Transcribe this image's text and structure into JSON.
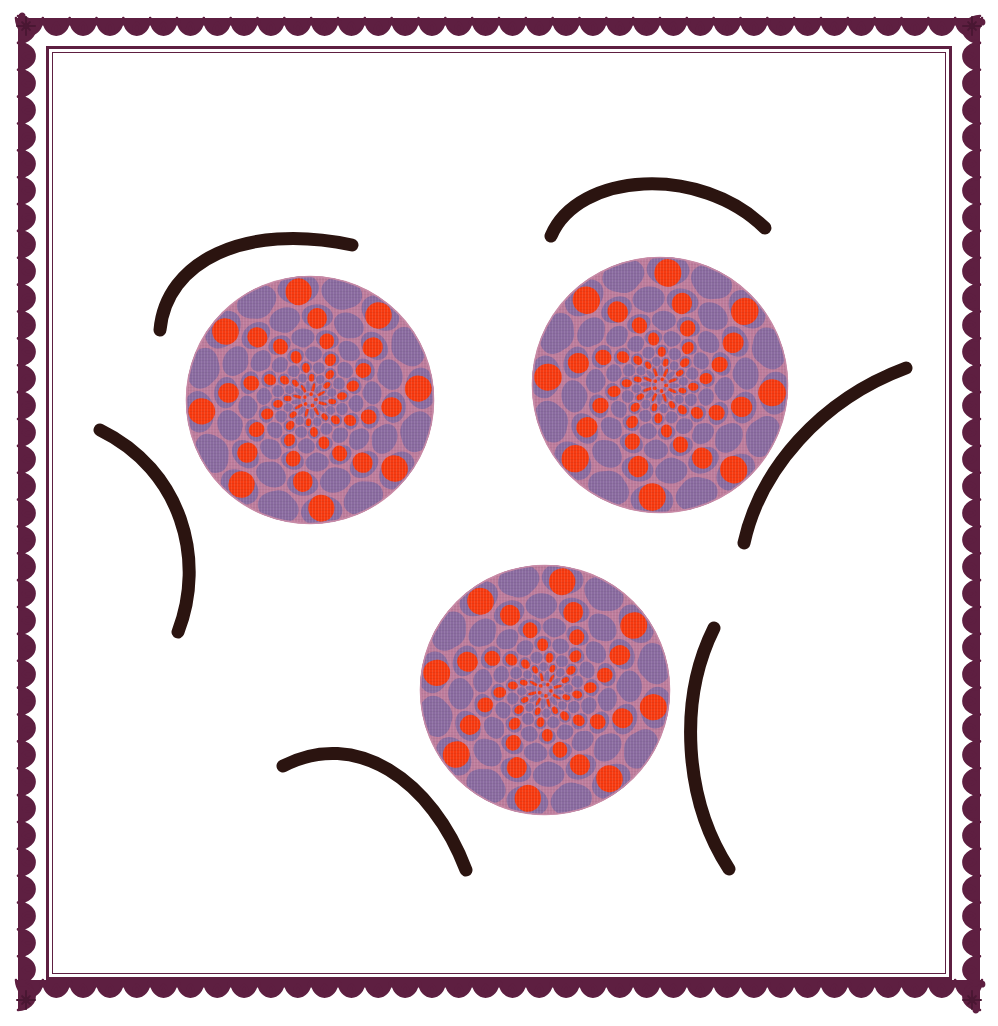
{
  "artwork": {
    "title": "Decorative Floral Rosette Panel",
    "canvas": {
      "width": 998,
      "height": 1026,
      "background": "#ffffff"
    },
    "palette": {
      "frame_ornament": "#5E1F41",
      "frame_ornament_dark": "#4A1733",
      "frame_line": "#5E1F41",
      "arc_stroke": "#2B1410",
      "petal_orange": "#F73A10",
      "petal_purple": "#8A6BA0",
      "disc_background": "#C98BA6",
      "disc_mauve": "#BE7C9C",
      "paper_white": "#ffffff"
    },
    "frame": {
      "name": "scalloped-lace-border",
      "outer_inset": 16,
      "scallop_band_thickness": 26,
      "scallop_period": 27,
      "rule_outer_offset": 46,
      "rule_inner_offset": 52,
      "rule_thickness_outer": 3,
      "rule_thickness_inner": 1,
      "corner_ornament": "starburst-floret"
    },
    "flowers": [
      {
        "id": "flower-top-left",
        "label": "Rosette 1",
        "cx": 310,
        "cy": 400,
        "radius": 124,
        "rings": 7,
        "petals_per_ring": 16,
        "rotation_per_ring_deg": 11,
        "base_rotation_deg": -6
      },
      {
        "id": "flower-top-right",
        "label": "Rosette 2",
        "cx": 660,
        "cy": 385,
        "radius": 128,
        "rings": 7,
        "petals_per_ring": 16,
        "rotation_per_ring_deg": 11,
        "base_rotation_deg": 4
      },
      {
        "id": "flower-bottom-center",
        "label": "Rosette 3",
        "cx": 545,
        "cy": 690,
        "radius": 125,
        "rings": 7,
        "petals_per_ring": 16,
        "rotation_per_ring_deg": 11,
        "base_rotation_deg": 9
      }
    ],
    "arcs": [
      {
        "id": "arc-upper-left",
        "label": "Upper left arch",
        "path": "M 160 330 C 166 262 244 222 352 245",
        "width": 13
      },
      {
        "id": "arc-upper-right",
        "label": "Upper right arch",
        "path": "M 551 236 C 578 172 700 164 765 228",
        "width": 13
      },
      {
        "id": "arc-left-crescent",
        "label": "Left crescent",
        "path": "M 100 430 C 182 470 206 560 178 632",
        "width": 13
      },
      {
        "id": "arc-right-diagonal",
        "label": "Right diagonal sweep",
        "path": "M 906 368 C 820 400 760 470 744 543",
        "width": 13
      },
      {
        "id": "arc-lower-left",
        "label": "Lower left sweep",
        "path": "M 283 766 C 356 728 432 780 466 870",
        "width": 13
      },
      {
        "id": "arc-lower-right",
        "label": "Lower right crescent",
        "path": "M 714 628 C 678 700 684 800 729 869",
        "width": 13
      }
    ]
  },
  "chart_data": {
    "type": "scatter",
    "note": "Ornamental composition: three concentric-petal rosettes with six tapered brush arcs inside a scalloped lace frame.",
    "xlabel": "",
    "ylabel": "",
    "xlim": [
      0,
      998
    ],
    "ylim": [
      0,
      1026
    ],
    "grid": false,
    "legend": "none",
    "series": [
      {
        "name": "rosettes",
        "marker": "rosette",
        "points": [
          {
            "x": 310,
            "y": 400,
            "r": 124
          },
          {
            "x": 660,
            "y": 385,
            "r": 128
          },
          {
            "x": 545,
            "y": 690,
            "r": 125
          }
        ]
      },
      {
        "name": "arcs",
        "marker": "stroke",
        "points": [
          {
            "x": 256,
            "y": 262
          },
          {
            "x": 658,
            "y": 192
          },
          {
            "x": 148,
            "y": 530
          },
          {
            "x": 825,
            "y": 455
          },
          {
            "x": 374,
            "y": 800
          },
          {
            "x": 700,
            "y": 748
          }
        ]
      }
    ]
  }
}
